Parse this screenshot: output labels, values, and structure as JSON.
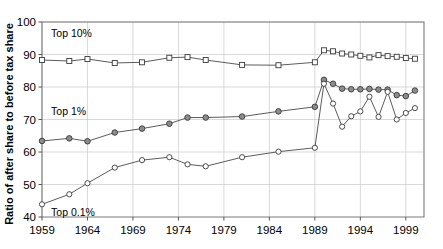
{
  "chart_data": {
    "type": "line",
    "title": "",
    "xlabel": "",
    "ylabel": "Ratio of after share to before tax share",
    "xlim": [
      1959,
      2001
    ],
    "ylim": [
      40,
      100
    ],
    "xticks": [
      1959,
      1964,
      1969,
      1974,
      1979,
      1984,
      1989,
      1994,
      1999
    ],
    "yticks": [
      40,
      50,
      60,
      70,
      80,
      90,
      100
    ],
    "grid": true,
    "legend_position": "inline-annotations",
    "annotations": [
      {
        "label": "Top 10%",
        "x": 1960,
        "y": 96.5
      },
      {
        "label": "Top 1%",
        "x": 1960,
        "y": 72.5
      },
      {
        "label": "Top 0.1%",
        "x": 1960,
        "y": 41.5
      }
    ],
    "series": [
      {
        "name": "Top 10%",
        "marker": "square-open",
        "x": [
          1959,
          1962,
          1964,
          1967,
          1970,
          1973,
          1975,
          1977,
          1981,
          1985,
          1989,
          1990,
          1991,
          1992,
          1993,
          1994,
          1995,
          1996,
          1997,
          1998,
          1999,
          2000
        ],
        "values": [
          88.3,
          88.0,
          88.6,
          87.4,
          87.6,
          89.0,
          89.2,
          88.3,
          86.8,
          86.7,
          87.6,
          91.3,
          91.0,
          90.3,
          90.0,
          89.6,
          89.1,
          89.8,
          89.5,
          89.3,
          88.9,
          88.7
        ]
      },
      {
        "name": "Top 1%",
        "marker": "circle-filled",
        "x": [
          1959,
          1962,
          1964,
          1967,
          1970,
          1973,
          1975,
          1977,
          1981,
          1985,
          1989,
          1990,
          1991,
          1992,
          1993,
          1994,
          1995,
          1996,
          1997,
          1998,
          1999,
          2000
        ],
        "values": [
          63.4,
          64.2,
          63.3,
          66.0,
          67.2,
          68.7,
          70.6,
          70.6,
          70.9,
          72.5,
          73.9,
          82.2,
          81.0,
          79.5,
          79.3,
          79.3,
          79.4,
          79.2,
          79.2,
          77.5,
          77.2,
          78.9
        ]
      },
      {
        "name": "Top 0.1%",
        "marker": "circle-open",
        "x": [
          1959,
          1962,
          1964,
          1967,
          1970,
          1973,
          1975,
          1977,
          1981,
          1985,
          1989,
          1990,
          1991,
          1992,
          1993,
          1994,
          1995,
          1996,
          1997,
          1998,
          1999,
          2000
        ],
        "values": [
          43.9,
          47.0,
          50.4,
          55.2,
          57.5,
          58.4,
          56.2,
          55.6,
          58.4,
          60.1,
          61.3,
          81.0,
          74.9,
          67.8,
          71.0,
          72.5,
          77.0,
          70.8,
          78.5,
          70.0,
          72.0,
          73.5
        ]
      }
    ]
  }
}
